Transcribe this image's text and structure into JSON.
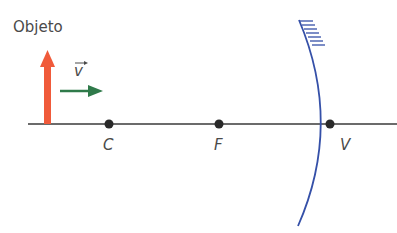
{
  "labels": {
    "object": "Objeto",
    "velocity": "v",
    "center": "C",
    "focus": "F",
    "vertex": "V"
  },
  "colors": {
    "axis": "#3a3a3a",
    "object_arrow": "#f05a3a",
    "velocity_arrow": "#2f7a4a",
    "mirror": "#3550a8",
    "points": "#2a2a2a"
  }
}
